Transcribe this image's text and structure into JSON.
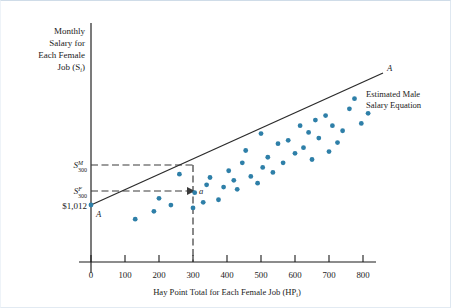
{
  "chart_data": {
    "type": "scatter",
    "title": "",
    "xlabel": "Hay Point Total for Each Female Job (HP",
    "xlabel_sub": "i",
    "xlabel_tail": ")",
    "ylabel_lines": [
      "Monthly",
      "Salary for",
      "Each Female",
      "Job (S"
    ],
    "ylabel_sub": "i",
    "ylabel_tail": ")",
    "xlim": [
      0,
      880
    ],
    "ylim": [
      0,
      3200
    ],
    "xticks": [
      0,
      100,
      200,
      300,
      400,
      500,
      600,
      700,
      800
    ],
    "xticklabels": [
      "0",
      "100",
      "200",
      "300",
      "400",
      "500",
      "600",
      "700",
      "800"
    ],
    "grid": false,
    "legend": "none",
    "series": [
      {
        "name": "Female jobs",
        "marker": "circle",
        "color": "#2e7fa8",
        "points": [
          [
            130,
            760
          ],
          [
            185,
            900
          ],
          [
            200,
            1130
          ],
          [
            235,
            1010
          ],
          [
            260,
            1560
          ],
          [
            300,
            960
          ],
          [
            305,
            1230
          ],
          [
            330,
            1060
          ],
          [
            340,
            1370
          ],
          [
            350,
            1500
          ],
          [
            375,
            1105
          ],
          [
            390,
            1330
          ],
          [
            405,
            1620
          ],
          [
            420,
            1450
          ],
          [
            430,
            1290
          ],
          [
            445,
            1760
          ],
          [
            455,
            1980
          ],
          [
            470,
            1520
          ],
          [
            490,
            1400
          ],
          [
            500,
            2280
          ],
          [
            505,
            1680
          ],
          [
            520,
            1860
          ],
          [
            535,
            1590
          ],
          [
            550,
            2100
          ],
          [
            565,
            1760
          ],
          [
            580,
            2160
          ],
          [
            600,
            1930
          ],
          [
            615,
            2420
          ],
          [
            625,
            2030
          ],
          [
            640,
            2300
          ],
          [
            650,
            1820
          ],
          [
            660,
            2520
          ],
          [
            670,
            2200
          ],
          [
            690,
            2600
          ],
          [
            700,
            1960
          ],
          [
            710,
            2420
          ],
          [
            725,
            2120
          ],
          [
            740,
            2330
          ],
          [
            760,
            2720
          ],
          [
            775,
            2900
          ],
          [
            795,
            2460
          ],
          [
            815,
            2640
          ]
        ]
      }
    ],
    "fit_line": {
      "label": "A",
      "label_start": "A",
      "note_lines": [
        "Estimated Male",
        "Salary Equation"
      ],
      "intercept_value": 1012,
      "intercept_label": "$1,012",
      "x_start": 0,
      "x_end": 860,
      "y_start": 1012,
      "y_end": 3010
    },
    "annotations": [
      {
        "name": "male-salary-marker",
        "base": "S",
        "sup": "M",
        "sub": "300",
        "value": 1755
      },
      {
        "name": "female-salary-marker",
        "base": "S",
        "sup": "F",
        "sub": "300",
        "value": 1395
      },
      {
        "name": "point-a-label",
        "text": "a",
        "x": 300,
        "y": 1395
      }
    ],
    "reference_x": 300
  }
}
